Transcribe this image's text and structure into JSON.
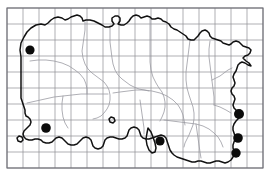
{
  "figure": {
    "type": "dot-distribution-map",
    "caption": "",
    "width": 271,
    "height": 181
  },
  "colors": {
    "grid": "#8c8c94",
    "frame": "#6e6e76",
    "coastline": "#111111",
    "inland_boundary": "#9a9aa2",
    "dot": "#0b0b0b",
    "background": "#ffffff"
  },
  "grid": {
    "origin_x": 7,
    "origin_y": 8,
    "cell_size": 16,
    "columns": 16,
    "rows": 10,
    "right": 263,
    "bottom": 168,
    "visible": true
  },
  "map_data": {
    "type": "distribution-map",
    "region": "Southern England",
    "symbol": "filled-circle",
    "dot_radius": 4.6,
    "records": [
      {
        "id": "record-1",
        "x": 30,
        "y": 50,
        "r": 4.6
      },
      {
        "id": "record-2",
        "x": 46,
        "y": 128,
        "r": 4.8
      },
      {
        "id": "record-3",
        "x": 160,
        "y": 141,
        "r": 4.6
      },
      {
        "id": "record-4",
        "x": 239,
        "y": 114,
        "r": 5.0
      },
      {
        "id": "record-5",
        "x": 238,
        "y": 138,
        "r": 4.8
      },
      {
        "id": "record-6",
        "x": 236,
        "y": 153,
        "r": 4.7
      }
    ],
    "record_count": 6
  },
  "geometry": {
    "coastline": "M 21 57 L 20 50 L 21 43 L 24 37 L 27 32 L 31 28 L 36 25 L 41 24 L 45 25 L 48 23 L 51 20 L 54 18 L 58 17 L 62 18 L 65 20 L 68 19 L 71 17 L 74 16 L 77 15 L 80 16 L 82 18 L 83 21 L 86 20 L 90 20 L 94 21 L 98 23 L 102 25 L 105 27 L 109 27 L 112 26 L 114 24 L 112 21 L 112 18 L 115 16 L 118 16 L 120 18 L 120 21 L 118 24 L 121 25 L 124 25 L 127 23 L 129 21 L 131 18 L 133 16 L 136 15 L 139 16 L 141 18 L 144 17 L 147 16 L 150 17 L 152 19 L 155 19 L 158 18 L 161 19 L 163 21 L 166 22 L 169 24 L 171 27 L 174 29 L 177 30 L 180 32 L 183 34 L 186 36 L 188 39 L 191 40 L 194 40 L 196 38 L 198 36 L 200 33 L 202 31 L 205 30 L 207 31 L 209 33 L 210 36 L 212 38 L 215 39 L 218 40 L 221 41 L 223 43 L 226 44 L 229 45 L 231 44 L 233 42 L 236 41 L 239 42 L 241 44 L 243 46 L 246 47 L 249 48 L 251 50 L 250 53 L 248 55 L 245 56 L 243 58 L 246 61 L 249 63 L 251 66 L 248 65 L 245 63 L 242 62 L 240 63 L 238 65 L 237 68 L 236 71 L 234 74 L 233 77 L 234 80 L 235 83 L 234 86 L 232 88 L 231 91 L 232 94 L 234 96 L 235 99 L 234 102 L 233 105 L 234 108 L 236 110 L 238 113 L 239 116 L 238 119 L 236 121 L 234 124 L 233 127 L 233 130 L 234 133 L 235 136 L 235 139 L 234 142 L 233 145 L 233 148 L 234 151 L 234 154 L 233 157 L 231 160 L 228 162 L 225 163 L 222 162 L 219 161 L 216 161 L 213 162 L 210 163 L 207 163 L 204 162 L 201 161 L 198 161 L 195 162 L 192 162 L 189 161 L 186 160 L 183 159 L 180 158 L 177 157 L 174 155 L 172 153 L 170 150 L 169 147 L 168 144 L 167 141 L 166 138 L 164 136 L 161 135 L 158 136 L 155 137 L 152 138 L 149 139 L 146 139 L 143 138 L 141 136 L 140 133 L 139 130 L 137 128 L 134 127 L 131 128 L 129 130 L 128 133 L 127 136 L 125 138 L 122 139 L 119 139 L 116 138 L 113 137 L 110 137 L 107 138 L 105 140 L 104 143 L 103 146 L 101 148 L 98 149 L 95 148 L 93 146 L 92 143 L 91 140 L 89 138 L 86 137 L 83 138 L 81 140 L 79 142 L 77 144 L 74 145 L 71 145 L 68 144 L 66 142 L 64 140 L 62 138 L 59 137 L 56 138 L 54 140 L 52 142 L 49 143 L 46 143 L 43 142 L 41 140 L 38 139 L 35 139 L 32 140 L 29 140 L 26 139 L 24 137 L 23 134 L 24 131 L 26 129 L 28 127 L 30 125 L 31 122 L 30 119 L 28 117 L 26 116 L 25 113 L 25 110 L 24 107 L 23 104 L 22 101 L 21 98 L 21 95 L 21 92 L 21 89 L 21 86 L 21 83 L 21 80 L 21 77 L 21 74 L 21 71 L 21 68 L 21 65 L 21 62 Z",
    "inland_boundaries": [
      "M 85 22 L 85 30 L 84 37 L 83 44 L 82 51 L 83 58 L 85 64 L 88 69 L 92 73 L 96 76 L 100 79 L 104 82 L 107 86 L 109 90 L 110 95 L 110 100 L 109 105 L 107 109 L 104 113 L 101 116 L 97 118 L 93 119",
      "M 110 26 L 110 34 L 110 42 L 111 50 L 112 58 L 113 64 L 115 70 L 118 75 L 122 79 L 126 82 L 130 85 L 134 87 L 139 89 L 144 90 L 149 91",
      "M 150 18 L 150 27 L 150 36 L 150 45 L 150 54 L 150 62 L 151 70 L 153 77 L 156 83 L 159 88 L 162 92 L 164 97 L 165 102 L 165 107 L 164 112 L 162 117 L 160 121",
      "M 190 40 L 189 48 L 188 56 L 187 64 L 186 72 L 186 80 L 187 88 L 189 95 L 191 101 L 193 107 L 194 113 L 194 119 L 193 125 L 191 130 L 189 135 L 187 139 L 185 143 L 184 147",
      "M 113 93 L 120 92 L 128 91 L 136 90 L 144 90 L 152 91 L 160 93 L 167 96 L 173 100 L 178 105 L 181 110 L 183 115 L 184 120 L 185 125",
      "M 27 103 L 36 101 L 45 99 L 54 97 L 63 96 L 72 95 L 81 94 L 90 94 L 99 94 L 108 94",
      "M 164 120 L 172 121 L 180 122 L 188 123 L 196 124 L 203 126 L 209 129 L 214 133 L 218 137 L 221 142 L 223 147",
      "M 196 124 L 197 131 L 198 138 L 199 145 L 200 152 L 201 158",
      "M 210 41 L 209 49 L 209 57 L 210 65 L 211 73 L 212 81 L 213 89 L 214 97 L 214 105",
      "M 214 105 L 220 107 L 226 110 L 231 113",
      "M 232 68 L 228 70 L 224 73 L 220 76 L 216 78 L 212 80",
      "M 63 96 L 62 103 L 62 110 L 63 117 L 65 123 L 68 128",
      "M 140 100 L 141 107 L 142 114 L 143 121 L 144 128 L 144 134",
      "M 30 61 L 38 60 L 46 60 L 54 61 L 62 63 L 69 66 L 75 70 L 80 74 L 84 79 L 86 84 L 87 89 L 87 94"
    ],
    "islands": [
      "M 148 128 L 147 133 L 146 139 L 147 145 L 149 150 L 152 153 L 155 152 L 156 148 L 155 143 L 153 137 L 151 132 Z",
      "M 19 136 L 17 138 L 18 141 L 21 142 L 23 140 L 22 137 Z",
      "M 111 117 L 109 119 L 110 122 L 113 123 L 115 121 L 114 118 Z"
    ]
  }
}
